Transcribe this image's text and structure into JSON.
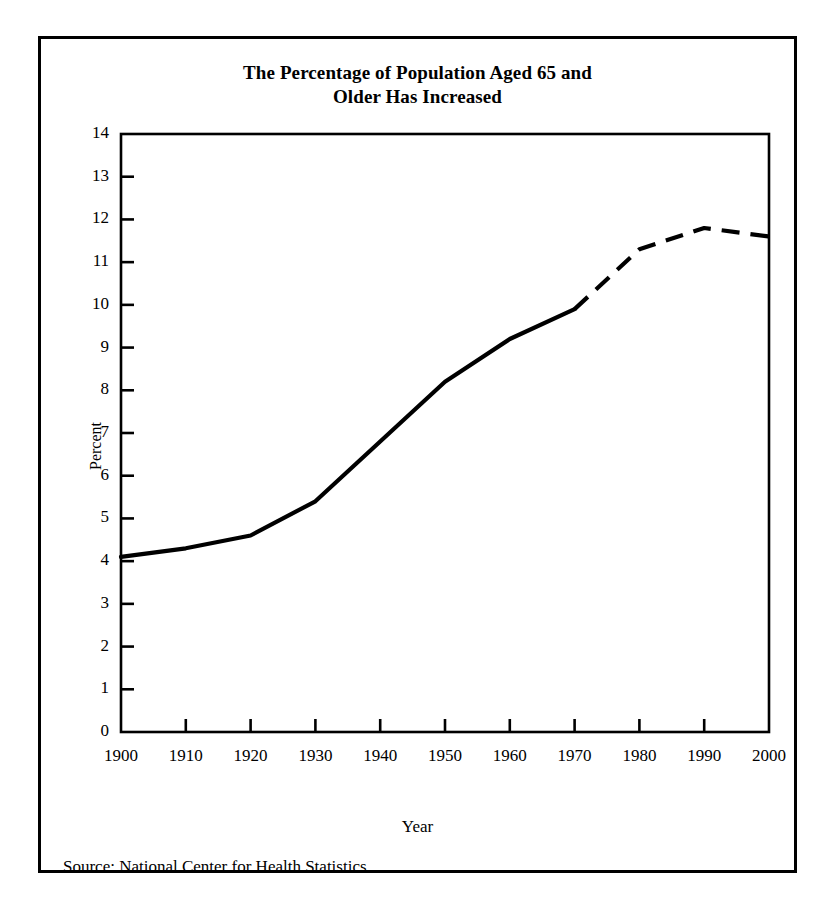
{
  "figure": {
    "title_lines": [
      "The Percentage of Population Aged 65 and",
      "Older Has Increased"
    ],
    "source": "Source: National Center for Health Statistics",
    "frame_color": "#000000",
    "background_color": "#ffffff",
    "line_color": "#000000"
  },
  "chart_data": {
    "type": "line",
    "title": "The Percentage of Population Aged 65 and Older Has Increased",
    "xlabel": "Year",
    "ylabel": "Percent",
    "xlim": [
      1900,
      2000
    ],
    "ylim": [
      0,
      14
    ],
    "grid": false,
    "legend": "none",
    "x": [
      1900,
      1910,
      1920,
      1930,
      1940,
      1950,
      1960,
      1970,
      1980,
      1990,
      2000
    ],
    "xticks": [
      "1900",
      "1910",
      "1920",
      "1930",
      "1940",
      "1950",
      "1960",
      "1970",
      "1980",
      "1990",
      "2000"
    ],
    "yticks": [
      "0",
      "1",
      "2",
      "3",
      "4",
      "5",
      "6",
      "7",
      "8",
      "9",
      "10",
      "11",
      "12",
      "13",
      "14"
    ],
    "series": [
      {
        "name": "Percent of population aged 65 and older",
        "values": [
          4.1,
          4.3,
          4.6,
          5.4,
          6.8,
          8.2,
          9.2,
          9.9,
          11.3,
          11.8,
          11.6
        ],
        "style_solid_through": 1970,
        "style_dashed_from": 1970,
        "annotation": "Solid line through 1970, dashed (projected) from 1970 to 2000"
      }
    ]
  }
}
